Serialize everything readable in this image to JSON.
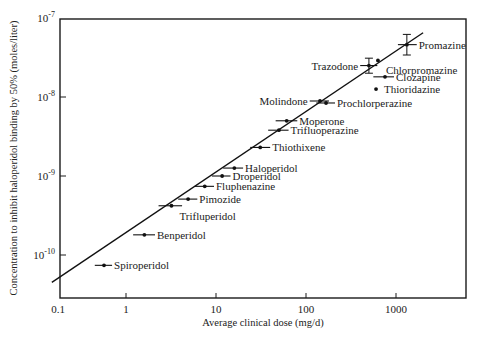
{
  "chart_data": {
    "type": "scatter",
    "title": "",
    "xlabel": "Average clinical dose (mg/d)",
    "ylabel": "Concentration to inhibit haloperidol binding by 50% (moles/liter)",
    "x_scale": "log",
    "y_scale": "log",
    "xlim": [
      0.1,
      5000
    ],
    "ylim": [
      3e-11,
      1e-07
    ],
    "x_ticks": [
      {
        "value": 0.1,
        "label": "0.1"
      },
      {
        "value": 1,
        "label": "1"
      },
      {
        "value": 10,
        "label": "10"
      },
      {
        "value": 100,
        "label": "100"
      },
      {
        "value": 1000,
        "label": "1000"
      }
    ],
    "y_ticks": [
      {
        "value": 1e-07,
        "base": "10",
        "exp": "-7"
      },
      {
        "value": 1e-08,
        "base": "10",
        "exp": "-8"
      },
      {
        "value": 1e-09,
        "base": "10",
        "exp": "-9"
      },
      {
        "value": 1e-10,
        "base": "10",
        "exp": "-10"
      }
    ],
    "grid": false,
    "legend": null,
    "regression_line": {
      "x": [
        0.15,
        2000
      ],
      "y": [
        4.5e-11,
        6.5e-08
      ]
    },
    "points": [
      {
        "name": "Spiroperidol",
        "x": 0.57,
        "y": 7.4e-11,
        "xerr": [
          0.45,
          0.7
        ],
        "label_pos": "right"
      },
      {
        "name": "Benperidol",
        "x": 1.6,
        "y": 1.8e-10,
        "xerr": [
          1.2,
          2.1
        ],
        "label_pos": "right"
      },
      {
        "name": "Trifluperidol",
        "x": 3.2,
        "y": 4.2e-10,
        "xerr": [
          2.3,
          4.2
        ],
        "label_pos": "below-right"
      },
      {
        "name": "Pimozide",
        "x": 4.9,
        "y": 5.1e-10,
        "xerr": [
          3.8,
          6.2
        ],
        "label_pos": "right"
      },
      {
        "name": "Fluphenazine",
        "x": 7.5,
        "y": 7.4e-10,
        "xerr": [
          5.8,
          9.5
        ],
        "label_pos": "right"
      },
      {
        "name": "Droperidol",
        "x": 11.7,
        "y": 1e-09,
        "xerr": [
          9.0,
          14.5
        ],
        "label_pos": "right"
      },
      {
        "name": "Haloperidol",
        "x": 16,
        "y": 1.26e-09,
        "xerr": [
          12,
          20
        ],
        "label_pos": "right"
      },
      {
        "name": "Thiothixene",
        "x": 31,
        "y": 2.3e-09,
        "xerr": [
          24,
          40
        ],
        "label_pos": "right"
      },
      {
        "name": "Trifluoperazine",
        "x": 50,
        "y": 3.8e-09,
        "xerr": [
          38,
          64
        ],
        "label_pos": "right"
      },
      {
        "name": "Moperone",
        "x": 61,
        "y": 5e-09,
        "xerr": [
          46,
          80
        ],
        "label_pos": "right"
      },
      {
        "name": "Molindone",
        "x": 143,
        "y": 8.9e-09,
        "xerr": [
          110,
          180
        ],
        "label_pos": "left"
      },
      {
        "name": "Prochlorperazine",
        "x": 167,
        "y": 8.4e-09,
        "xerr": [
          130,
          210
        ],
        "label_pos": "right"
      },
      {
        "name": "Trazodone",
        "x": 500,
        "y": 2.5e-08,
        "xerr": [
          400,
          620
        ],
        "yerr": [
          2e-08,
          3.1e-08
        ],
        "label_pos": "left"
      },
      {
        "name": "Chlorpromazine",
        "x": 630,
        "y": 2.9e-08,
        "label_pos": "below-right"
      },
      {
        "name": "Clozapine",
        "x": 755,
        "y": 1.8e-08,
        "xerr": [
          560,
          950
        ],
        "label_pos": "right"
      },
      {
        "name": "Thioridazine",
        "x": 600,
        "y": 1.26e-08,
        "label_pos": "right"
      },
      {
        "name": "Promazine",
        "x": 1320,
        "y": 4.6e-08,
        "xerr": [
          1050,
          1700
        ],
        "yerr": [
          3.4e-08,
          6.2e-08
        ],
        "label_pos": "right"
      }
    ]
  }
}
